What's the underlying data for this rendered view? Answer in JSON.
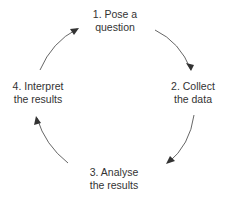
{
  "diagram": {
    "type": "cycle",
    "colors": {
      "text": "#333333",
      "arrow": "#555555",
      "background": "#ffffff"
    },
    "steps": [
      {
        "id": 1,
        "line1": "1. Pose a",
        "line2": "question",
        "x": 115,
        "y": 8
      },
      {
        "id": 2,
        "line1": "2. Collect",
        "line2": "the data",
        "x": 193,
        "y": 80
      },
      {
        "id": 3,
        "line1": "3. Analyse",
        "line2": "the results",
        "x": 114,
        "y": 166
      },
      {
        "id": 4,
        "line1": "4. Interpret",
        "line2": "the results",
        "x": 38,
        "y": 80
      }
    ],
    "arrows": [
      {
        "from": 1,
        "to": 2,
        "d": "M155,30 Q180,42 191,70",
        "head": [
          191,
          71,
          186,
          63,
          194,
          65
        ]
      },
      {
        "from": 2,
        "to": 3,
        "d": "M194,115 Q190,145 168,163",
        "head": [
          166,
          164,
          170,
          156,
          175,
          161
        ]
      },
      {
        "from": 3,
        "to": 4,
        "d": "M68,163 Q45,145 37,118",
        "head": [
          36,
          116,
          34,
          125,
          41,
          123
        ]
      },
      {
        "from": 4,
        "to": 1,
        "d": "M40,70 Q52,42 77,29",
        "head": [
          79,
          28,
          70,
          29,
          74,
          35
        ]
      }
    ]
  }
}
